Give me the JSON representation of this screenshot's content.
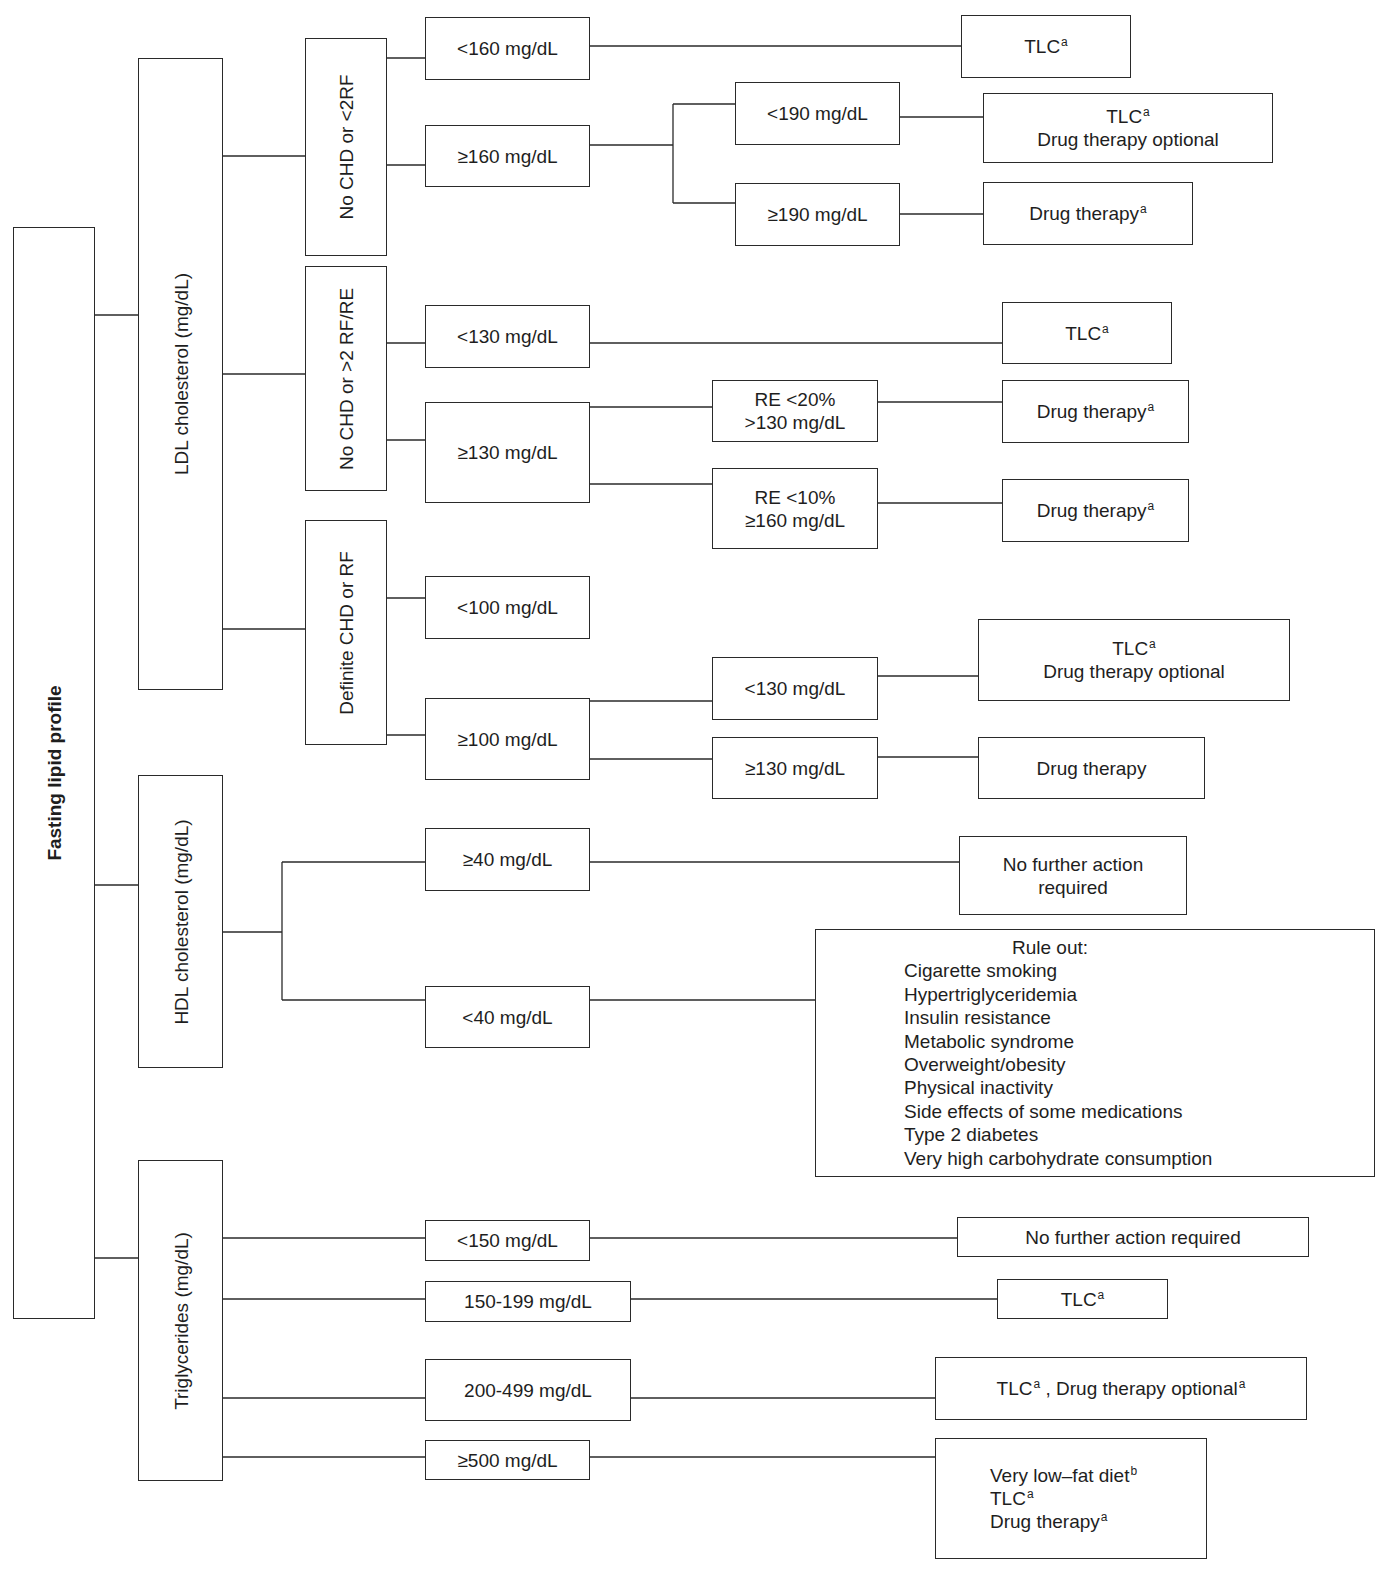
{
  "root": {
    "label": "Fasting lipid profile"
  },
  "ldl": {
    "label": "LDL cholesterol (mg/dL)",
    "groups": [
      {
        "label": "No CHD or <2RF",
        "branches": [
          {
            "label": "<160 mg/dL",
            "outcome": {
              "line1": "TLC",
              "sup1": "a"
            }
          },
          {
            "label": "≥160 mg/dL",
            "sub": [
              {
                "label": "<190 mg/dL",
                "outcome": {
                  "line1": "TLC",
                  "sup1": "a",
                  "line2": "Drug therapy optional"
                }
              },
              {
                "label": "≥190 mg/dL",
                "outcome": {
                  "line1": "Drug therapy",
                  "sup1": "a"
                }
              }
            ]
          }
        ]
      },
      {
        "label": "No CHD or >2 RF/RE",
        "branches": [
          {
            "label": "<130 mg/dL",
            "outcome": {
              "line1": "TLC",
              "sup1": "a"
            }
          },
          {
            "label": "≥130 mg/dL",
            "sub": [
              {
                "line1": "RE <20%",
                "line2": ">130 mg/dL",
                "outcome": {
                  "line1": "Drug therapy",
                  "sup1": "a"
                }
              },
              {
                "line1": "RE <10%",
                "line2": "≥160 mg/dL",
                "outcome": {
                  "line1": "Drug therapy",
                  "sup1": "a"
                }
              }
            ]
          }
        ]
      },
      {
        "label": "Definite CHD or RF",
        "branches": [
          {
            "label": "<100 mg/dL"
          },
          {
            "label": "≥100 mg/dL",
            "sub": [
              {
                "label": "<130 mg/dL",
                "outcome": {
                  "line1": "TLC",
                  "sup1": "a",
                  "line2": "Drug therapy optional"
                }
              },
              {
                "label": "≥130 mg/dL",
                "outcome": {
                  "line1": "Drug therapy"
                }
              }
            ]
          }
        ]
      }
    ]
  },
  "hdl": {
    "label": "HDL cholesterol (mg/dL)",
    "branches": [
      {
        "label": "≥40 mg/dL",
        "outcome": {
          "line1": "No further action",
          "line2": "required"
        }
      },
      {
        "label": "<40 mg/dL",
        "outcome": {
          "title": "Rule out:",
          "items": [
            "Cigarette smoking",
            "Hypertriglyceridemia",
            "Insulin resistance",
            "Metabolic syndrome",
            "Overweight/obesity",
            "Physical inactivity",
            "Side effects of some medications",
            "Type 2 diabetes",
            "Very high carbohydrate consumption"
          ]
        }
      }
    ]
  },
  "tg": {
    "label": "Triglycerides (mg/dL)",
    "branches": [
      {
        "label": "<150 mg/dL",
        "outcome": {
          "line1": "No further action required"
        }
      },
      {
        "label": "150-199 mg/dL",
        "outcome": {
          "line1": "TLC",
          "sup1": "a"
        }
      },
      {
        "label": "200-499 mg/dL",
        "outcome": {
          "line1": "TLC",
          "sup1": "a",
          "mid": " , Drug therapy optional",
          "sup2": "a"
        }
      },
      {
        "label": "≥500 mg/dL",
        "outcome": {
          "line1": "Very low–fat diet",
          "sup1": "b",
          "line2": "TLC",
          "sup2": "a",
          "line3": "Drug therapy",
          "sup3": "a"
        }
      }
    ]
  },
  "colors": {
    "line": "#2a2a2a",
    "text": "#1e1e1e",
    "background": "#ffffff"
  }
}
